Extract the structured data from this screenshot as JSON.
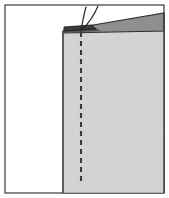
{
  "figure": {
    "title": "Sewing diagram: folded fabric edge with basting stitch line and thread tails",
    "type": "line-drawing",
    "width": 169,
    "height": 198,
    "background_color": "#ffffff",
    "frame": {
      "label": "illustration border",
      "stroke_color": "#3a3a3a",
      "stroke_width": 1.2,
      "x": 5,
      "y": 5,
      "width": 159,
      "height": 188,
      "fill": "#ffffff"
    },
    "shapes": {
      "fabric_panel": {
        "label": "main fabric panel",
        "fill_color": "#d4d4d4",
        "stroke_color": "#3a3a3a",
        "stroke_width": 1.1,
        "points": "63,31 164,31 164,193 63,193",
        "note": "large light grey fabric body filling right portion down to bottom border"
      },
      "folded_wedge": {
        "label": "folded-over fabric wedge",
        "fill_color": "#8f8f8f",
        "stroke_color": "#2f2f2f",
        "stroke_width": 1.1,
        "points": "64,30 164,13 164,31 64,33",
        "note": "dark grey tapering band along the top, thicker at right, narrowing to the left"
      },
      "fold_lip": {
        "label": "fold lip at stitch corner",
        "fill_color": "#3c3c3c",
        "stroke_color": "#1f1f1f",
        "stroke_width": 0.9,
        "points": "64,27 92,25 96,29 64,31",
        "note": "small dark sliver marking the turned-under edge near the stitch"
      },
      "fold_lip_shadow": {
        "label": "fold lip underside shadow",
        "fill_color": "#555555",
        "points": "64,30 96,28 101,31 64,33"
      }
    },
    "stitch_line": {
      "label": "basting stitch line",
      "style": "dashed",
      "stroke_color": "#3a3a3a",
      "stroke_width": 2.1,
      "dash_pattern": "5 4",
      "x": 81,
      "y_start": 32,
      "y_end": 182
    },
    "threads": [
      {
        "name": "thread-tail-left",
        "stroke_color": "#2b2b2b",
        "stroke_width": 1.2,
        "path": "M 81,30 C 83,20 84,14 86,7"
      },
      {
        "name": "thread-tail-right",
        "stroke_color": "#2b2b2b",
        "stroke_width": 1.2,
        "path": "M 81,31 C 88,24 94,16 98,6"
      }
    ],
    "colors": {
      "fabric_light": "#d4d4d4",
      "fabric_dark": "#8f8f8f",
      "fold_lip": "#3c3c3c",
      "outline": "#3a3a3a",
      "thread": "#2b2b2b",
      "paper": "#ffffff"
    }
  }
}
